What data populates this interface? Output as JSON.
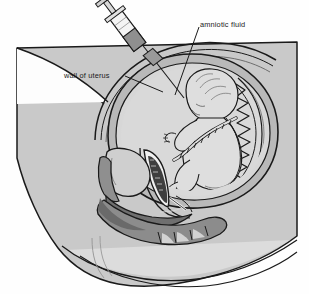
{
  "figure": {
    "background_color": "#fefefe"
  },
  "labels": {
    "amniotic_fluid": "amniotic fluid",
    "wall_of_uterus": "wall of uterus"
  },
  "palette": {
    "background": "#fefefe",
    "torso_fill": "#c9c9c9",
    "body_light": "#e2e2e2",
    "uterus_wall": "#b4b4b4",
    "amniotic_fluid": "#d7d7d7",
    "fetus_fill": "#dcdcdc",
    "rectum_fill": "#8c8c8c",
    "bladder_fill": "#bdbdbd",
    "outline": "#1a1a1a",
    "syringe_barrel": "#f2f2f2",
    "syringe_plunger": "#9a9a9a",
    "label_text": "#1a1a1a"
  },
  "parts": [
    {
      "name": "maternal-torso",
      "label": ""
    },
    {
      "name": "abdominal-wall",
      "label": ""
    },
    {
      "name": "uterus-wall",
      "label": "wall of uterus"
    },
    {
      "name": "amniotic-cavity",
      "label": "amniotic fluid"
    },
    {
      "name": "fetus",
      "label": ""
    },
    {
      "name": "placenta",
      "label": ""
    },
    {
      "name": "umbilical-cord",
      "label": ""
    },
    {
      "name": "bladder",
      "label": ""
    },
    {
      "name": "pubic-bone",
      "label": ""
    },
    {
      "name": "vagina",
      "label": ""
    },
    {
      "name": "rectum",
      "label": ""
    },
    {
      "name": "syringe",
      "label": ""
    },
    {
      "name": "needle",
      "label": ""
    }
  ]
}
